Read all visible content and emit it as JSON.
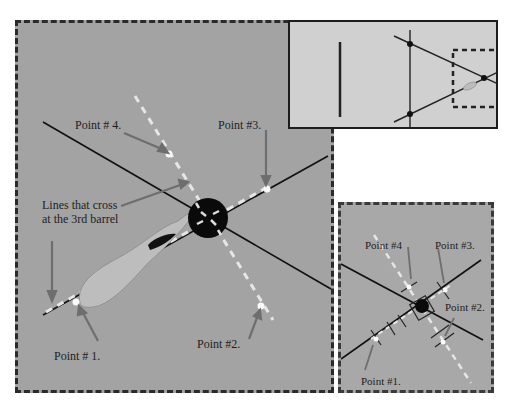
{
  "main_panel": {
    "labels": {
      "point4": "Point # 4.",
      "point3": "Point #3.",
      "lines_cross_line1": "Lines that cross",
      "lines_cross_line2": "at the 3rd barrel",
      "point1": "Point # 1.",
      "point2": "Point #2."
    }
  },
  "small_panel": {
    "labels": {
      "point4": "Point #4",
      "point3": "Point #3.",
      "point2": "Point #2.",
      "point1": "Point #1."
    }
  },
  "colors": {
    "main_bg": "#a3a3a3",
    "inset_bg": "#d0d0d0",
    "small_bg": "#a8a8a8",
    "line": "#111111",
    "dashed_line": "#e6e6e6",
    "arrow": "#6e6e6e",
    "shape_fill": "#bdbdbd"
  }
}
